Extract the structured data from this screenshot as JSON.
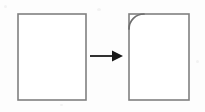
{
  "figure": {
    "background_color": "#fdfdfd",
    "stroke_color": "#808080",
    "arrow_color": "#1a1a1a",
    "stroke_width": 1.6,
    "width": 205,
    "height": 112
  },
  "shapes": {
    "source_rectangle": {
      "label": "source-rectangle",
      "x": 18,
      "y": 14,
      "width": 68,
      "height": 86,
      "corner_style": "square"
    },
    "result_rectangle": {
      "label": "result-rectangle",
      "x": 129,
      "y": 14,
      "width": 60,
      "height": 86,
      "corner_style": "square-with-fillet-arc"
    },
    "fillet_arc": {
      "label": "fillet-arc",
      "corner": "top-left",
      "radius": 15,
      "start_x": 129,
      "start_y": 29,
      "end_x": 144,
      "end_y": 14
    }
  },
  "arrow": {
    "label": "transform-arrow",
    "direction": "right",
    "start_x": 90,
    "end_x": 123,
    "y": 56,
    "shaft_width": 1.8,
    "head_length": 11,
    "head_width": 11
  }
}
